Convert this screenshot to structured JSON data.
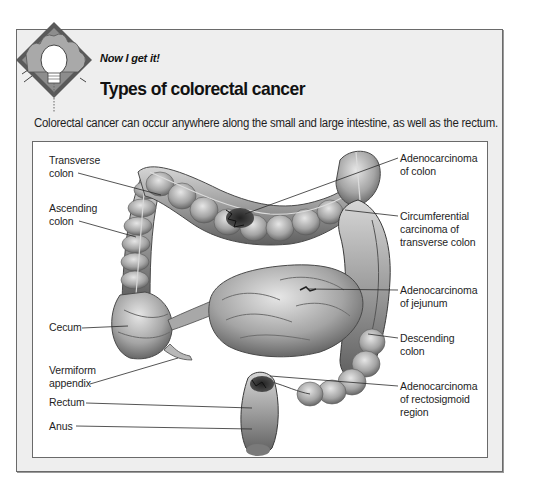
{
  "header": {
    "kicker": "Now I get it!",
    "title": "Types of colorectal cancer",
    "badge_icon": "lightbulb-icon"
  },
  "intro": "Colorectal cancer can occur anywhere along the small and large intestine, as well as the rectum.",
  "colors": {
    "panel_bg": "#eeeeee",
    "panel_border": "#6a6a6a",
    "inner_bg": "#ffffff",
    "text": "#1e1e1e",
    "leader_line": "#2a2a2a"
  },
  "figure": {
    "left_labels": [
      {
        "id": "transverse-colon",
        "lines": [
          "Transverse",
          "colon"
        ]
      },
      {
        "id": "ascending-colon",
        "lines": [
          "Ascending",
          "colon"
        ]
      },
      {
        "id": "cecum",
        "lines": [
          "Cecum"
        ]
      },
      {
        "id": "vermiform-appendix",
        "lines": [
          "Vermiform",
          "appendix"
        ]
      },
      {
        "id": "rectum",
        "lines": [
          "Rectum"
        ]
      },
      {
        "id": "anus",
        "lines": [
          "Anus"
        ]
      }
    ],
    "right_labels": [
      {
        "id": "adenocarcinoma-of-colon",
        "lines": [
          "Adenocarcinoma",
          "of colon"
        ]
      },
      {
        "id": "circumferential-carcinoma",
        "lines": [
          "Circumferential",
          "carcinoma of",
          "transverse colon"
        ]
      },
      {
        "id": "adenocarcinoma-of-jejunum",
        "lines": [
          "Adenocarcinoma",
          "of jejunum"
        ]
      },
      {
        "id": "descending-colon",
        "lines": [
          "Descending",
          "colon"
        ]
      },
      {
        "id": "adenocarcinoma-rectosigmoid",
        "lines": [
          "Adenocarcinoma",
          "of rectosigmoid",
          "region"
        ]
      }
    ]
  }
}
